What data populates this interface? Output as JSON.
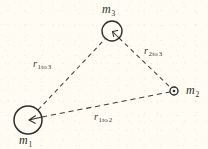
{
  "figure": {
    "kind": "three-body gravitation diagram",
    "background_color": "#fffdf3",
    "stroke_color": "#3a3a35",
    "width": 208,
    "height": 149
  },
  "bodies": [
    {
      "id": "m1",
      "label_main": "m",
      "label_sub": "1",
      "cx": 28,
      "cy": 120,
      "r": 14,
      "has_radius_arrow": true
    },
    {
      "id": "m2",
      "label_main": "m",
      "label_sub": "2",
      "cx": 174,
      "cy": 91,
      "r": 4,
      "has_radius_arrow": false
    },
    {
      "id": "m3",
      "label_main": "m",
      "label_sub": "3",
      "cx": 112,
      "cy": 31,
      "r": 10,
      "has_radius_arrow": true
    }
  ],
  "connectors": [
    {
      "id": "r1to3",
      "from": "m1",
      "to": "m3",
      "style": "dashed",
      "label_main": "r",
      "label_sub": "1",
      "label_to": "to",
      "label_sub2": "3"
    },
    {
      "id": "r2to3",
      "from": "m2",
      "to": "m3",
      "style": "dashed",
      "label_main": "r",
      "label_sub": "2",
      "label_to": "to",
      "label_sub2": "3"
    },
    {
      "id": "r1to2",
      "from": "m1",
      "to": "m2",
      "style": "dashed",
      "label_main": "r",
      "label_sub": "1",
      "label_to": "to",
      "label_sub2": "2"
    }
  ]
}
